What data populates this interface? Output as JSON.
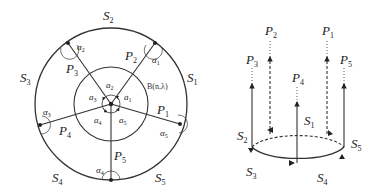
{
  "left_diagram": {
    "outer_labels": [
      {
        "id": "S2",
        "base": "S",
        "sub": "2"
      },
      {
        "id": "S1",
        "base": "S",
        "sub": "1"
      },
      {
        "id": "S3",
        "base": "S",
        "sub": "3"
      },
      {
        "id": "S4",
        "base": "S",
        "sub": "4"
      },
      {
        "id": "S5",
        "base": "S",
        "sub": "5"
      }
    ],
    "path_labels": [
      {
        "id": "P1",
        "base": "P",
        "sub": "1"
      },
      {
        "id": "P2",
        "base": "P",
        "sub": "2"
      },
      {
        "id": "P3",
        "base": "P",
        "sub": "3"
      },
      {
        "id": "P4",
        "base": "P",
        "sub": "4"
      },
      {
        "id": "P5",
        "base": "P",
        "sub": "5"
      }
    ],
    "outer_angles": [
      {
        "id": "a1",
        "base": "α",
        "sub": "1"
      },
      {
        "id": "a2",
        "base": "α",
        "sub": "2"
      },
      {
        "id": "a3",
        "base": "α",
        "sub": "3"
      },
      {
        "id": "a4",
        "base": "α",
        "sub": "4"
      },
      {
        "id": "a5",
        "base": "α",
        "sub": "5"
      }
    ],
    "inner_angles": [
      {
        "id": "a1",
        "base": "a",
        "sub": "1"
      },
      {
        "id": "a2",
        "base": "a",
        "sub": "2"
      },
      {
        "id": "a3",
        "base": "a",
        "sub": "3"
      },
      {
        "id": "a4",
        "base": "a",
        "sub": "4"
      },
      {
        "id": "a5",
        "base": "a",
        "sub": "5"
      }
    ],
    "ball_label": "B(n,λ)"
  },
  "right_diagram": {
    "path_labels": [
      {
        "id": "P1",
        "base": "P",
        "sub": "1"
      },
      {
        "id": "P2",
        "base": "P",
        "sub": "2"
      },
      {
        "id": "P3",
        "base": "P",
        "sub": "3"
      },
      {
        "id": "P4",
        "base": "P",
        "sub": "4"
      },
      {
        "id": "P5",
        "base": "P",
        "sub": "5"
      }
    ],
    "segment_labels": [
      {
        "id": "S1",
        "base": "S",
        "sub": "1"
      },
      {
        "id": "S2",
        "base": "S",
        "sub": "2"
      },
      {
        "id": "S3",
        "base": "S",
        "sub": "3"
      },
      {
        "id": "S4",
        "base": "S",
        "sub": "4"
      },
      {
        "id": "S5",
        "base": "S",
        "sub": "5"
      }
    ]
  }
}
